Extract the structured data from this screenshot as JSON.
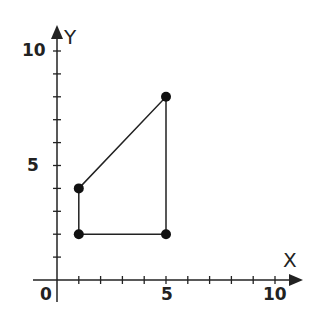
{
  "chart_data": {
    "type": "scatter",
    "title": "",
    "xlabel": "X",
    "ylabel": "Y",
    "xlim": [
      0,
      10
    ],
    "ylim": [
      0,
      10
    ],
    "grid": false,
    "x_tick_labels": [
      "0",
      "5",
      "10"
    ],
    "y_tick_labels": [
      "5",
      "10"
    ],
    "x_ticks": [
      1,
      2,
      3,
      4,
      5,
      6,
      7,
      8,
      9,
      10
    ],
    "y_ticks": [
      1,
      2,
      3,
      4,
      5,
      6,
      7,
      8,
      9,
      10
    ],
    "series": [
      {
        "name": "quadrilateral",
        "closed": true,
        "points": [
          [
            1,
            2
          ],
          [
            1,
            4
          ],
          [
            5,
            8
          ],
          [
            5,
            2
          ]
        ]
      }
    ],
    "colors": {
      "line": "#222222",
      "point": "#111111",
      "axis": "#222222"
    }
  },
  "labels": {
    "origin": "0",
    "x5": "5",
    "x10": "10",
    "y5": "5",
    "y10": "10",
    "x_axis": "X",
    "y_axis": "Y"
  }
}
